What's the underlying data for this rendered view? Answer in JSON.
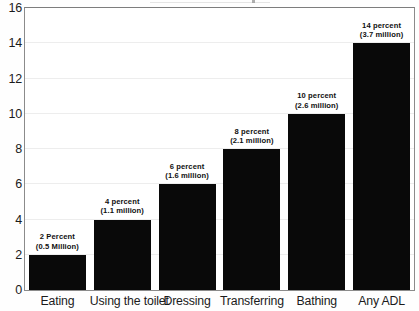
{
  "chart_data": {
    "type": "bar",
    "title": "",
    "subtitle": "",
    "xlabel": "",
    "ylabel": "",
    "ylim": [
      0,
      16
    ],
    "yticks": [
      0,
      2,
      4,
      6,
      8,
      10,
      12,
      14,
      16
    ],
    "grid": true,
    "legend": false,
    "legend_position": "none",
    "bar_color": "#090909",
    "categories": [
      "Eating",
      "Using the toilet",
      "Dressing",
      "Transferring",
      "Bathing",
      "Any ADL"
    ],
    "values": [
      2,
      4,
      6,
      8,
      10,
      14
    ],
    "annotations": [
      {
        "percent": "2 Percent",
        "count": "(0.5 Million)"
      },
      {
        "percent": "4 percent",
        "count": "(1.1 million)"
      },
      {
        "percent": "6 percent",
        "count": "(1.6 million)"
      },
      {
        "percent": "8 percent",
        "count": "(2.1 million)"
      },
      {
        "percent": "10 percent",
        "count": "(2.6 million)"
      },
      {
        "percent": "14 percent",
        "count": "(3.7 million)"
      }
    ]
  }
}
